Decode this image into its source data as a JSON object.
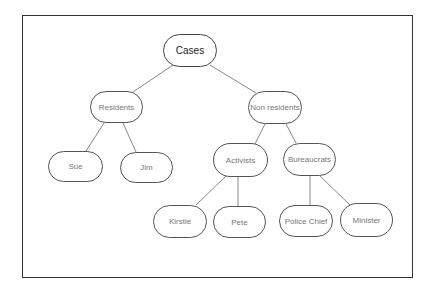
{
  "diagram": {
    "type": "tree",
    "nodes": [
      {
        "id": "cases",
        "label": "Cases",
        "x": 163,
        "y": 34,
        "w": 54,
        "h": 33,
        "root": true
      },
      {
        "id": "residents",
        "label": "Residents",
        "x": 90,
        "y": 91,
        "w": 53,
        "h": 32
      },
      {
        "id": "non-residents",
        "label": "Non residents",
        "x": 248,
        "y": 91,
        "w": 54,
        "h": 33
      },
      {
        "id": "sue",
        "label": "Sue",
        "x": 48,
        "y": 151,
        "w": 55,
        "h": 31
      },
      {
        "id": "jim",
        "label": "Jim",
        "x": 120,
        "y": 152,
        "w": 53,
        "h": 31
      },
      {
        "id": "activists",
        "label": "Activists",
        "x": 213,
        "y": 143,
        "w": 55,
        "h": 34
      },
      {
        "id": "bureaucrats",
        "label": "Bureaucrats",
        "x": 283,
        "y": 143,
        "w": 53,
        "h": 33
      },
      {
        "id": "kirstie",
        "label": "Kirstie",
        "x": 153,
        "y": 205,
        "w": 54,
        "h": 33
      },
      {
        "id": "pete",
        "label": "Pete",
        "x": 213,
        "y": 206,
        "w": 53,
        "h": 32
      },
      {
        "id": "police-chief",
        "label": "Police Chief",
        "x": 279,
        "y": 205,
        "w": 54,
        "h": 32
      },
      {
        "id": "minister",
        "label": "Minister",
        "x": 340,
        "y": 203,
        "w": 53,
        "h": 34
      }
    ],
    "edges": [
      {
        "from": "cases",
        "to": "residents",
        "x1": 173,
        "y1": 65,
        "x2": 133,
        "y2": 92
      },
      {
        "from": "cases",
        "to": "non-residents",
        "x1": 210,
        "y1": 65,
        "x2": 256,
        "y2": 93
      },
      {
        "from": "residents",
        "to": "sue",
        "x1": 104,
        "y1": 123,
        "x2": 86,
        "y2": 151
      },
      {
        "from": "residents",
        "to": "jim",
        "x1": 123,
        "y1": 123,
        "x2": 136,
        "y2": 152
      },
      {
        "from": "non-residents",
        "to": "activists",
        "x1": 265,
        "y1": 124,
        "x2": 255,
        "y2": 144
      },
      {
        "from": "non-residents",
        "to": "bureaucrats",
        "x1": 286,
        "y1": 124,
        "x2": 296,
        "y2": 143
      },
      {
        "from": "activists",
        "to": "kirstie",
        "x1": 226,
        "y1": 176,
        "x2": 196,
        "y2": 205
      },
      {
        "from": "activists",
        "to": "pete",
        "x1": 238,
        "y1": 177,
        "x2": 238,
        "y2": 206
      },
      {
        "from": "bureaucrats",
        "to": "police-chief",
        "x1": 310,
        "y1": 176,
        "x2": 310,
        "y2": 205
      },
      {
        "from": "bureaucrats",
        "to": "minister",
        "x1": 320,
        "y1": 176,
        "x2": 350,
        "y2": 205
      }
    ]
  },
  "colors": {
    "frame": "#333333",
    "edge": "#888888",
    "node_border": "#555555",
    "text": "#777777",
    "root_text": "#222222"
  }
}
